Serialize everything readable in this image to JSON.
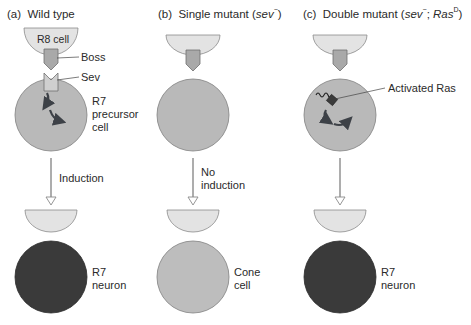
{
  "panels": [
    {
      "id": "a",
      "letter": "(a)",
      "title": "Wild type",
      "labels": {
        "r8_cell": "R8 cell",
        "boss": "Boss",
        "sev": "Sev",
        "precursor": [
          "R7",
          "precursor",
          "cell"
        ],
        "arrow": "Induction",
        "outcome": [
          "R7",
          "neuron"
        ]
      },
      "outcome_color": "#3a3a3a"
    },
    {
      "id": "b",
      "letter": "(b)",
      "title_prefix": "Single mutant (",
      "title_italic": "sev",
      "title_sup": "−",
      "title_suffix": ")",
      "labels": {
        "arrow": [
          "No",
          "induction"
        ],
        "outcome": [
          "Cone",
          "cell"
        ]
      },
      "outcome_color": "#bdbdbd"
    },
    {
      "id": "c",
      "letter": "(c)",
      "title_prefix": "Double mutant (",
      "title_italic": "sev",
      "title_sup": "−",
      "title_mid": "; ",
      "title_italic2": "Ras",
      "title_sup2": "D",
      "title_suffix": ")",
      "labels": {
        "activated_ras": "Activated Ras",
        "outcome": [
          "R7",
          "neuron"
        ]
      },
      "outcome_color": "#3a3a3a"
    }
  ],
  "colors": {
    "r8_cell": "#e3e3e3",
    "precursor_cell": "#b9b9b9",
    "boss": "#a9a9a9",
    "sev": "#cfcfcf",
    "neuron": "#3a3a3a",
    "cone": "#bdbdbd",
    "arrow_line": "#8a8a8a",
    "ras": "#3b3b3b",
    "signal_arrow": "#3d4147"
  }
}
